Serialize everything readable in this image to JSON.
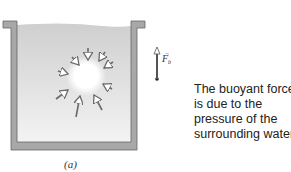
{
  "figure": {
    "panel_label": "(a)",
    "force_label": "F",
    "force_subscript": "b",
    "caption_lines": [
      "The buoyant force",
      "is due to the",
      "pressure of the",
      "surrounding water."
    ],
    "colors": {
      "wall": "#a8a8a8",
      "water_top": "#d0d0d0",
      "water_bottom": "#f2f2f2",
      "arrow": "#6a6a6a"
    }
  }
}
